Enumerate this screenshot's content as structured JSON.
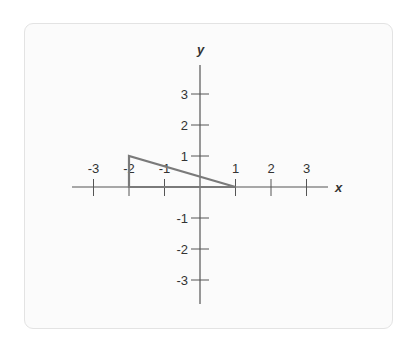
{
  "diagram": {
    "type": "coordinate-plane",
    "x_axis_label": "x",
    "y_axis_label": "y",
    "x_ticks": [
      {
        "value": -3,
        "label": "-3"
      },
      {
        "value": -2,
        "label": "-2"
      },
      {
        "value": -1,
        "label": "-1"
      },
      {
        "value": 1,
        "label": "1"
      },
      {
        "value": 2,
        "label": "2"
      },
      {
        "value": 3,
        "label": "3"
      }
    ],
    "y_ticks": [
      {
        "value": 3,
        "label": "3"
      },
      {
        "value": 2,
        "label": "2"
      },
      {
        "value": 1,
        "label": "1"
      },
      {
        "value": -1,
        "label": "-1"
      },
      {
        "value": -2,
        "label": "-2"
      },
      {
        "value": -3,
        "label": "-3"
      }
    ],
    "shape": {
      "type": "triangle",
      "vertices": [
        [
          -2,
          0
        ],
        [
          -2,
          1
        ],
        [
          1,
          0
        ]
      ],
      "stroke_color": "#7a7a7a"
    },
    "colors": {
      "axis": "#555555",
      "card_background": "#fbfbfb",
      "card_border": "#e3e3e3"
    }
  }
}
